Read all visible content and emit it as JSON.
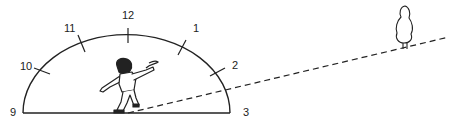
{
  "diagram": {
    "clock_labels": {
      "nine": "9",
      "ten": "10",
      "eleven": "11",
      "twelve": "12",
      "one": "1",
      "two": "2",
      "three": "3"
    },
    "colors": {
      "ink": "#222222",
      "background": "#ffffff"
    }
  }
}
